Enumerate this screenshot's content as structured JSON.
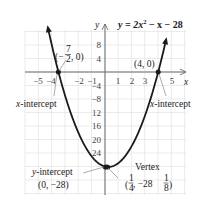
{
  "chart_data": {
    "type": "line",
    "equation": "y = 2x^2 - x - 28",
    "xlabel": "x",
    "ylabel": "y",
    "xlim": [
      -6,
      6
    ],
    "ylim": [
      -36,
      12
    ],
    "grid": true,
    "x_ticks": [
      -5,
      -4,
      -2,
      -1,
      1,
      2,
      3,
      5
    ],
    "x_tick_labels": [
      "−5",
      "−4",
      "−2",
      "−1",
      "1",
      "2",
      "3",
      "5"
    ],
    "y_ticks": [
      8,
      4,
      -4,
      -8,
      -12,
      -16,
      -20,
      -24
    ],
    "y_tick_labels": [
      "8",
      "4",
      "−4",
      "−8",
      "12",
      "16",
      "20",
      "24"
    ],
    "series": [
      {
        "name": "y = 2x^2 - x - 28",
        "x": [
          -4.3,
          -4,
          -3.5,
          -3,
          -2,
          -1,
          0,
          0.25,
          1,
          2,
          3,
          4,
          4.6
        ],
        "values": [
          13.28,
          8,
          0,
          -7,
          -18,
          -25,
          -28,
          -28.125,
          -27,
          -22,
          -13,
          0,
          9.72
        ]
      }
    ],
    "annotations": [
      {
        "label": "(−7/2, 0)",
        "x": -3.5,
        "y": 0,
        "note": "x-intercept"
      },
      {
        "label": "(4, 0)",
        "x": 4,
        "y": 0,
        "note": "x-intercept"
      },
      {
        "label": "y-intercept (0, −28)",
        "x": 0,
        "y": -28
      },
      {
        "label": "Vertex (1/4, −28 1/8)",
        "x": 0.25,
        "y": -28.125
      }
    ]
  },
  "labels": {
    "title_prefix": "y = 2x",
    "title_exp": "2",
    "title_suffix": " − x − 28",
    "axis_x": "x",
    "axis_y": "y",
    "left_intercept_point_open": "(−",
    "left_intercept_num": "7",
    "left_intercept_den": "2",
    "left_intercept_close": ", 0)",
    "right_intercept_point": "(4, 0)",
    "x_intercept_left": "x-intercept",
    "x_intercept_right": "x-intercept",
    "y_intercept_title": "y-intercept",
    "y_intercept_point": "(0, −28)",
    "vertex_title": "Vertex",
    "vertex_open": "(",
    "vertex_num": "1",
    "vertex_den": "4",
    "vertex_mid": ", −28",
    "vertex_frac_num": "1",
    "vertex_frac_den": "8",
    "vertex_close": ")"
  },
  "ticks": {
    "x": [
      {
        "label": "−5",
        "px": 38
      },
      {
        "label": "−4",
        "px": 51
      },
      {
        "label": "−2",
        "px": 79
      },
      {
        "label": "−1",
        "px": 92
      },
      {
        "label": "1",
        "px": 118
      },
      {
        "label": "2",
        "px": 132
      },
      {
        "label": "3",
        "px": 145
      },
      {
        "label": "5",
        "px": 172
      }
    ],
    "y": [
      {
        "label": "8",
        "py": 45
      },
      {
        "label": "4",
        "py": 59
      },
      {
        "label": "−4",
        "py": 86
      },
      {
        "label": "−8",
        "py": 99
      },
      {
        "label": "12",
        "py": 113
      },
      {
        "label": "16",
        "py": 126
      },
      {
        "label": "20",
        "py": 140
      },
      {
        "label": "24",
        "py": 153
      }
    ]
  },
  "colors": {
    "curve": "#1a1a1a",
    "axis": "#6a6a6a",
    "grid": "#e2e2e2",
    "text": "#222222"
  }
}
